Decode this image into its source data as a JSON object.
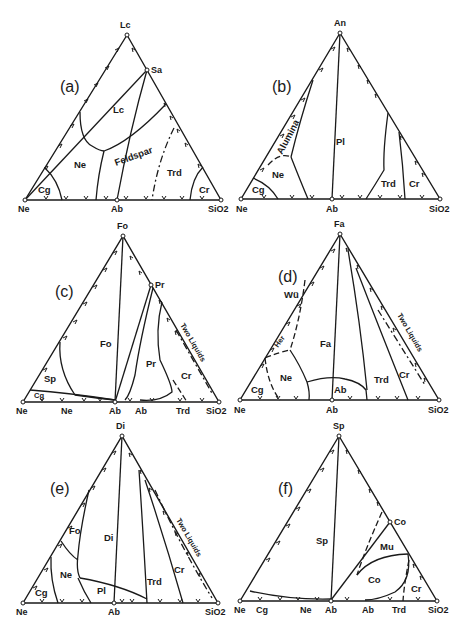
{
  "figure": {
    "panels": [
      {
        "id": "a",
        "panel_label": "(a)",
        "vertices": {
          "left": "Ne",
          "mid": "Ab",
          "right": "SiO2",
          "apex": "Lc",
          "extra": "Sa"
        },
        "fields": [
          "Lc",
          "Ne",
          "Feldspar",
          "Trd",
          "Cr",
          "Cg"
        ]
      },
      {
        "id": "b",
        "panel_label": "(b)",
        "vertices": {
          "left": "Ne",
          "mid": "Ab",
          "right": "SiO2",
          "apex": "An"
        },
        "fields": [
          "Alumina",
          "Pl",
          "Ne",
          "Cg",
          "Trd",
          "Cr"
        ]
      },
      {
        "id": "c",
        "panel_label": "(c)",
        "vertices": {
          "left": "Ne",
          "mid": "Ab",
          "right": "SiO2",
          "apex": "Fo",
          "extra": "Pr"
        },
        "fields": [
          "Fo",
          "Pr",
          "Sp",
          "Cr",
          "Cg",
          "Two Liquids"
        ],
        "bottom_fields": [
          "Ne",
          "Ab",
          "Trd"
        ]
      },
      {
        "id": "d",
        "panel_label": "(d)",
        "vertices": {
          "left": "Ne",
          "mid": "Ab",
          "right": "SiO2",
          "apex": "Fa"
        },
        "fields": [
          "Wü",
          "Her",
          "Fa",
          "Ne",
          "Ab",
          "Trd",
          "Cr",
          "Cg",
          "Two Liquids"
        ]
      },
      {
        "id": "e",
        "panel_label": "(e)",
        "vertices": {
          "left": "Ne",
          "mid": "Ab",
          "right": "SiO2",
          "apex": "Di"
        },
        "fields": [
          "Fo",
          "Di",
          "Ne",
          "Pl",
          "Trd",
          "Cr",
          "Cg",
          "Two Liquids"
        ]
      },
      {
        "id": "f",
        "panel_label": "(f)",
        "vertices": {
          "left": "Ne",
          "mid": "Ab",
          "right": "SiO2",
          "apex": "Sp",
          "extra": "Co"
        },
        "fields": [
          "Sp",
          "Mu",
          "Co",
          "Cr"
        ],
        "bottom_fields": [
          "Cg",
          "Ne",
          "Ab",
          "Trd"
        ]
      }
    ],
    "sio2_sub": "2"
  }
}
